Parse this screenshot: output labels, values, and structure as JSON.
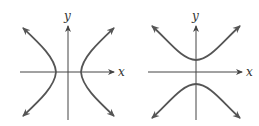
{
  "figures": [
    {
      "name": "horizontal-hyperbola",
      "orientation": "opens left-right",
      "x_label": "x",
      "y_label": "y"
    },
    {
      "name": "vertical-hyperbola",
      "orientation": "opens up-down",
      "x_label": "x",
      "y_label": "y"
    }
  ],
  "colors": {
    "curve": "#555555",
    "axis": "#444444"
  }
}
